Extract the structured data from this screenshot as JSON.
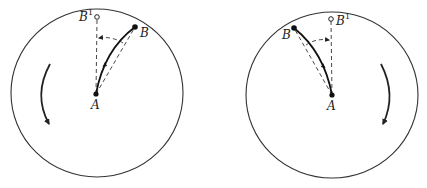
{
  "figure": {
    "panels": [
      {
        "id": "left",
        "rotation": "counterclockwise",
        "labels": {
          "A": "A",
          "B": "B",
          "B1": "B",
          "B1_sup": "1"
        }
      },
      {
        "id": "right",
        "rotation": "clockwise",
        "labels": {
          "A": "A",
          "B": "B",
          "B1": "B",
          "B1_sup": "1"
        }
      }
    ],
    "colors": {
      "stroke": "#333333",
      "background": "#ffffff"
    }
  }
}
